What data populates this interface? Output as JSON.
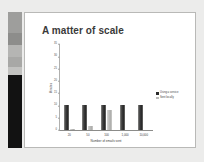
{
  "window": {
    "background_color": "#ececeb"
  },
  "sidebar": {
    "name": "slide-thumbnail-strip",
    "thumbnails": [
      {
        "id": "thumb-1",
        "tone": "#9e9e9c"
      },
      {
        "id": "thumb-2",
        "tone": "#8d8d8b"
      },
      {
        "id": "thumb-3",
        "tone": "#b5b5b3"
      },
      {
        "id": "thumb-4",
        "tone": "#a8a8a6"
      },
      {
        "id": "thumb-5",
        "tone": "#c2c2c0"
      },
      {
        "id": "thumb-6",
        "tone": "#121212"
      }
    ]
  },
  "slide": {
    "title": "A matter of scale",
    "background_color": "#ffffff",
    "border_color": "#b9b9b7"
  },
  "chart_data": {
    "type": "bar",
    "title": "A matter of scale",
    "xlabel": "Number of emails sent",
    "ylabel": "Minutes",
    "categories": [
      "20",
      "50",
      "100",
      "1,000",
      "10,000"
    ],
    "series": [
      {
        "name": "Using a service",
        "color": "#2b2b2b",
        "values": [
          10,
          10,
          10,
          10,
          10
        ]
      },
      {
        "name": "Sent locally",
        "color": "#bcbcba",
        "values": [
          0.5,
          1.5,
          8,
          0,
          0
        ]
      }
    ],
    "ylim": [
      0,
      35
    ],
    "yticks": [
      "0",
      "5",
      "10",
      "15",
      "20",
      "25",
      "30",
      "35"
    ],
    "grid": false,
    "legend_position": "right"
  }
}
